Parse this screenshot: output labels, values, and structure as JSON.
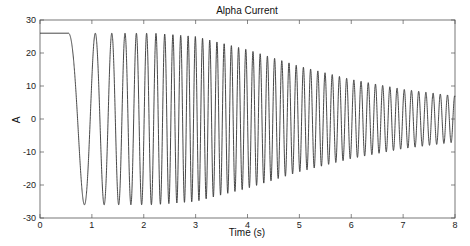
{
  "chart_data": {
    "type": "line",
    "title": "Alpha Current",
    "xlabel": "Time (s)",
    "ylabel": "A",
    "xlim": [
      0,
      8
    ],
    "ylim": [
      -30,
      30
    ],
    "xticks": [
      0,
      1,
      2,
      3,
      4,
      5,
      6,
      7,
      8
    ],
    "yticks": [
      -30,
      -20,
      -10,
      0,
      10,
      20,
      30
    ],
    "xtick_labels": [
      "0",
      "1",
      "2",
      "3",
      "4",
      "5",
      "6",
      "7",
      "8"
    ],
    "ytick_labels": [
      "-30",
      "-20",
      "-10",
      "0",
      "10",
      "20",
      "30"
    ],
    "grid": false,
    "legend": null,
    "series": [
      {
        "name": "Alpha Current",
        "description": "Flat at ~26 A until ~0.55 s, then oscillating (chirp) with increasing frequency; amplitude ~26 A until ~3 s, decaying to ~7 A at 8 s",
        "initial_level": 26,
        "step_time": 0.55,
        "peaks": [
          {
            "t": 0.96,
            "v": 26
          },
          {
            "t": 1.35,
            "v": 26
          },
          {
            "t": 1.66,
            "v": 26
          },
          {
            "t": 1.93,
            "v": 26
          },
          {
            "t": 2.2,
            "v": 26
          },
          {
            "t": 3.0,
            "v": 25
          },
          {
            "t": 4.0,
            "v": 21
          },
          {
            "t": 5.0,
            "v": 16
          },
          {
            "t": 6.0,
            "v": 12
          },
          {
            "t": 7.0,
            "v": 9
          },
          {
            "t": 8.0,
            "v": 7
          }
        ],
        "troughs": [
          {
            "t": 0.7,
            "v": -26
          },
          {
            "t": 1.12,
            "v": -26
          },
          {
            "t": 1.47,
            "v": -26
          },
          {
            "t": 1.76,
            "v": -26
          },
          {
            "t": 2.03,
            "v": -26
          },
          {
            "t": 3.0,
            "v": -25
          },
          {
            "t": 4.0,
            "v": -21
          },
          {
            "t": 5.0,
            "v": -16
          },
          {
            "t": 6.0,
            "v": -12
          },
          {
            "t": 7.0,
            "v": -9
          },
          {
            "t": 8.0,
            "v": -7
          }
        ]
      }
    ]
  }
}
